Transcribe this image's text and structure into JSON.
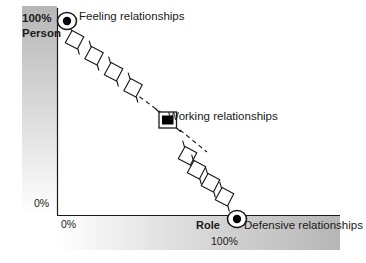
{
  "diagram": {
    "axes": {
      "y_axis_name": "Person",
      "y_axis_max_label": "100%",
      "y_axis_min_label": "0%",
      "x_axis_name": "Role",
      "x_axis_max_label": "100%",
      "x_axis_min_label": "0%"
    },
    "annotations": [
      {
        "id": "feeling",
        "label": "Feeling relationships",
        "marker": "bullseye-marker"
      },
      {
        "id": "working",
        "label": "Working relationships",
        "marker": "screen-marker"
      },
      {
        "id": "defensive",
        "label": "Defensive relationships",
        "marker": "bullseye-marker"
      }
    ],
    "colors": {
      "line": "#1a1a1a",
      "text": "#1a1a1a",
      "band_dark": "#b9b9b9",
      "band_light": "#ffffff",
      "marker_fill": "#000000"
    },
    "chain_links": {
      "upper_count": 4,
      "lower_count": 4
    }
  }
}
